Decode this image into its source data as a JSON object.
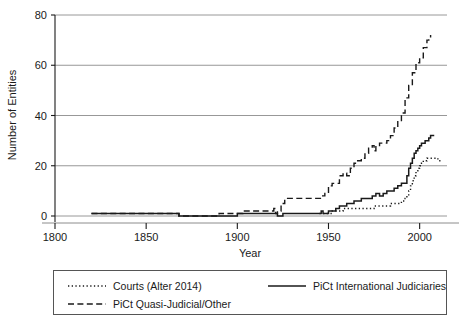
{
  "chart_data": {
    "type": "line",
    "title": "",
    "xlabel": "Year",
    "ylabel": "Number of Entities",
    "xlim": [
      1800,
      2015
    ],
    "ylim": [
      0,
      80
    ],
    "xticks": [
      1800,
      1850,
      1900,
      1950,
      2000
    ],
    "xtick_labels": [
      "1800",
      "1850",
      "1900",
      "1950",
      "2000"
    ],
    "yticks": [
      0,
      20,
      40,
      60,
      80
    ],
    "ytick_labels": [
      "0",
      "20",
      "40",
      "60",
      "80"
    ],
    "grid": "horizontal",
    "legend_position": "below-axes",
    "series": [
      {
        "name": "Courts (Alter 2014)",
        "style": "dotted",
        "color": "#1a1a1a",
        "x": [
          1945,
          1948,
          1950,
          1952,
          1955,
          1958,
          1960,
          1963,
          1965,
          1968,
          1970,
          1973,
          1975,
          1978,
          1980,
          1982,
          1984,
          1986,
          1988,
          1990,
          1991,
          1992,
          1993,
          1994,
          1995,
          1996,
          1997,
          1998,
          1999,
          2000,
          2001,
          2002,
          2003,
          2004,
          2005,
          2006,
          2008,
          2010,
          2012
        ],
        "y": [
          1,
          1,
          1,
          2,
          2,
          3,
          3,
          3,
          3,
          3,
          3,
          3,
          4,
          4,
          4,
          4,
          5,
          5,
          5,
          6,
          6,
          7,
          8,
          10,
          12,
          14,
          16,
          18,
          19,
          20,
          21,
          22,
          22,
          23,
          23,
          23,
          23,
          22,
          22
        ]
      },
      {
        "name": "PiCt International Judiciaries",
        "style": "solid",
        "color": "#1a1a1a",
        "x": [
          1820,
          1845,
          1866,
          1868,
          1890,
          1900,
          1910,
          1918,
          1920,
          1922,
          1925,
          1930,
          1935,
          1940,
          1944,
          1946,
          1947,
          1948,
          1950,
          1952,
          1954,
          1956,
          1958,
          1960,
          1962,
          1964,
          1966,
          1968,
          1970,
          1972,
          1974,
          1976,
          1978,
          1980,
          1982,
          1984,
          1986,
          1988,
          1990,
          1992,
          1993,
          1994,
          1995,
          1996,
          1997,
          1998,
          1999,
          2000,
          2001,
          2002,
          2003,
          2004,
          2005,
          2006,
          2008
        ],
        "y": [
          1,
          1,
          1,
          0,
          0,
          1,
          1,
          1,
          1,
          0,
          1,
          1,
          1,
          1,
          1,
          2,
          1,
          1,
          2,
          2,
          3,
          4,
          4,
          5,
          5,
          6,
          6,
          7,
          7,
          7,
          8,
          9,
          8,
          9,
          10,
          10,
          11,
          12,
          13,
          13,
          16,
          19,
          21,
          23,
          25,
          26,
          27,
          28,
          29,
          29,
          30,
          30,
          31,
          32,
          32
        ]
      },
      {
        "name": "PiCt Quasi-Judicial/Other",
        "style": "dashed",
        "color": "#1a1a1a",
        "x": [
          1820,
          1840,
          1860,
          1866,
          1868,
          1888,
          1890,
          1895,
          1900,
          1903,
          1907,
          1912,
          1918,
          1920,
          1921,
          1922,
          1924,
          1926,
          1928,
          1930,
          1935,
          1940,
          1944,
          1946,
          1948,
          1950,
          1952,
          1954,
          1956,
          1958,
          1960,
          1962,
          1964,
          1966,
          1968,
          1970,
          1972,
          1974,
          1975,
          1976,
          1978,
          1980,
          1982,
          1984,
          1986,
          1988,
          1990,
          1992,
          1994,
          1996,
          1998,
          2000,
          2002,
          2004,
          2005,
          2006
        ],
        "y": [
          1,
          1,
          1,
          1,
          0,
          0,
          1,
          1,
          1,
          2,
          2,
          2,
          2,
          3,
          1,
          2,
          5,
          7,
          7,
          7,
          7,
          7,
          7,
          8,
          9,
          12,
          13,
          13,
          16,
          17,
          16,
          19,
          21,
          22,
          23,
          25,
          27,
          28,
          26,
          28,
          29,
          29,
          30,
          32,
          35,
          38,
          41,
          47,
          52,
          57,
          61,
          63,
          67,
          70,
          71,
          72
        ]
      }
    ]
  },
  "legend": {
    "entries": [
      {
        "label": "Courts (Alter 2014)",
        "style": "dotted"
      },
      {
        "label": "PiCt International Judiciaries",
        "style": "solid"
      },
      {
        "label": "PiCt Quasi-Judicial/Other",
        "style": "dashed"
      }
    ]
  }
}
